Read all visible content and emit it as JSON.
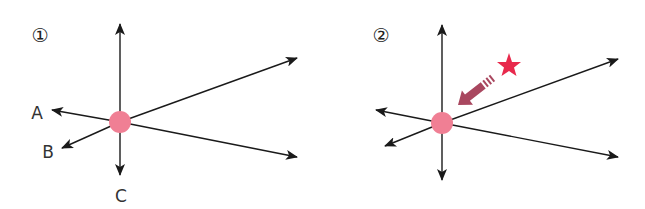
{
  "colors": {
    "line": "#1a1a1a",
    "dot": "#f07f94",
    "arrow": "#a9475f",
    "star": "#e8294c",
    "label": "#333333"
  },
  "panels": [
    {
      "number": "①",
      "center": [
        120,
        122
      ],
      "labels": {
        "a": "A",
        "b": "B",
        "c": "C"
      },
      "rays": [
        {
          "name": "up",
          "tip": [
            120,
            23
          ]
        },
        {
          "name": "down",
          "tip": [
            120,
            176
          ]
        },
        {
          "name": "upper-right",
          "tip": [
            298,
            58
          ]
        },
        {
          "name": "lower-right",
          "tip": [
            298,
            157
          ]
        },
        {
          "name": "left-A",
          "tip": [
            51,
            110
          ]
        },
        {
          "name": "lower-left-B",
          "tip": [
            61,
            149
          ]
        }
      ]
    },
    {
      "number": "②",
      "center": [
        442,
        123
      ],
      "marker": "star",
      "pointer": "arrow pointing to center",
      "rays": [
        {
          "name": "up",
          "tip": [
            442,
            24
          ]
        },
        {
          "name": "down",
          "tip": [
            442,
            181
          ]
        },
        {
          "name": "upper-right",
          "tip": [
            619,
            59
          ]
        },
        {
          "name": "lower-right",
          "tip": [
            619,
            157
          ]
        },
        {
          "name": "left",
          "tip": [
            375,
            110
          ]
        },
        {
          "name": "lower-left",
          "tip": [
            384,
            146
          ]
        }
      ]
    }
  ]
}
